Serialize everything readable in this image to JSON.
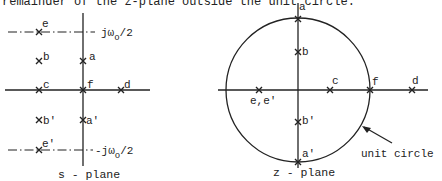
{
  "header_text": "remainder of the z-plane outside the unit circle.",
  "s_plane": {
    "caption": "s - plane",
    "upper_line_label": "jω",
    "upper_line_sub": "o",
    "upper_line_suffix": "/2",
    "lower_line_label": "-jω",
    "lower_line_sub": "o",
    "lower_line_suffix": "/2",
    "points": [
      {
        "id": "e",
        "label": "e"
      },
      {
        "id": "b",
        "label": "b"
      },
      {
        "id": "a",
        "label": "a"
      },
      {
        "id": "c",
        "label": "c"
      },
      {
        "id": "f",
        "label": "f"
      },
      {
        "id": "d",
        "label": "d"
      },
      {
        "id": "b_prime",
        "label": "b'"
      },
      {
        "id": "a_prime",
        "label": "a'"
      },
      {
        "id": "e_prime",
        "label": "e'"
      }
    ]
  },
  "z_plane": {
    "caption": "z - plane",
    "circle_label": "unit circle",
    "points": [
      {
        "id": "a",
        "label": "a"
      },
      {
        "id": "b",
        "label": "b"
      },
      {
        "id": "e_e_prime",
        "label": "e,e'"
      },
      {
        "id": "c",
        "label": "c"
      },
      {
        "id": "f",
        "label": "f"
      },
      {
        "id": "d",
        "label": "d"
      },
      {
        "id": "b_prime",
        "label": "b'"
      },
      {
        "id": "a_prime",
        "label": "a'"
      }
    ]
  }
}
